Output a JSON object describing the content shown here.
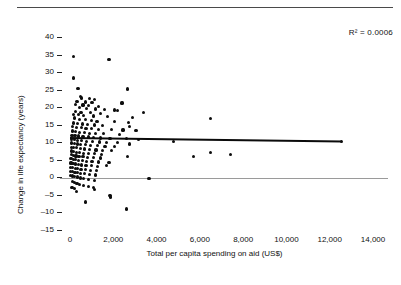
{
  "figure": {
    "has_top_rule": true,
    "background_color": "#ffffff",
    "point_color": "#0d0d0d",
    "trendline_color": "#0b0b0b",
    "zeroline_color": "#9a9a9a"
  },
  "annotations": {
    "r_squared": "R² = 0.0006"
  },
  "chart_data": {
    "type": "scatter",
    "title": "",
    "xlabel": "Total per capita spending on aid (US$)",
    "ylabel": "Change in life expectancy (years)",
    "xlim": [
      0,
      14000
    ],
    "ylim": [
      -15,
      40
    ],
    "xticks": [
      0,
      2000,
      4000,
      6000,
      8000,
      10000,
      12000,
      14000
    ],
    "xtick_labels": [
      "0",
      "2,000",
      "4,000",
      "6,000",
      "8,000",
      "10,000",
      "12,000",
      "14,000"
    ],
    "yticks": [
      -15,
      -10,
      -5,
      0,
      5,
      10,
      15,
      20,
      25,
      30,
      35,
      40
    ],
    "ytick_labels": [
      "–15",
      "–10",
      "–5",
      "0",
      "5",
      "10",
      "15",
      "20",
      "25",
      "30",
      "35",
      "40"
    ],
    "grid": false,
    "legend": null,
    "reference_lines": [
      {
        "name": "zero-line",
        "orientation": "horizontal",
        "y": 0
      }
    ],
    "trendline": {
      "name": "linear-fit",
      "x_start": 0,
      "y_start": 11.2,
      "x_end": 12550,
      "y_end": 10.2,
      "r_squared": 0.0006
    },
    "annotations": [
      {
        "text": "R² = 0.0006",
        "x": 12600,
        "y": 39
      }
    ],
    "points": [
      [
        150,
        34.5
      ],
      [
        1800,
        33.6
      ],
      [
        160,
        28.3
      ],
      [
        330,
        25.4
      ],
      [
        380,
        25.3
      ],
      [
        2650,
        25.2
      ],
      [
        480,
        23.0
      ],
      [
        540,
        22.6
      ],
      [
        900,
        22.4
      ],
      [
        1150,
        22.2
      ],
      [
        320,
        21.7
      ],
      [
        700,
        21.5
      ],
      [
        1020,
        21.3
      ],
      [
        2400,
        21.2
      ],
      [
        250,
        20.8
      ],
      [
        600,
        20.6
      ],
      [
        860,
        20.5
      ],
      [
        1300,
        20.1
      ],
      [
        430,
        19.9
      ],
      [
        760,
        19.7
      ],
      [
        1180,
        19.5
      ],
      [
        1600,
        19.4
      ],
      [
        2050,
        19.2
      ],
      [
        2200,
        19.0
      ],
      [
        240,
        18.8
      ],
      [
        510,
        18.6
      ],
      [
        940,
        18.4
      ],
      [
        1400,
        18.3
      ],
      [
        3400,
        18.5
      ],
      [
        180,
        18.0
      ],
      [
        390,
        17.8
      ],
      [
        640,
        17.7
      ],
      [
        1100,
        17.5
      ],
      [
        1750,
        17.4
      ],
      [
        2900,
        17.1
      ],
      [
        6500,
        16.7
      ],
      [
        210,
        16.9
      ],
      [
        450,
        16.6
      ],
      [
        700,
        16.4
      ],
      [
        980,
        16.2
      ],
      [
        1250,
        16.0
      ],
      [
        2050,
        15.9
      ],
      [
        2700,
        15.6
      ],
      [
        170,
        15.5
      ],
      [
        360,
        15.3
      ],
      [
        560,
        15.2
      ],
      [
        820,
        15.0
      ],
      [
        1150,
        14.9
      ],
      [
        1500,
        14.7
      ],
      [
        2750,
        14.6
      ],
      [
        130,
        14.5
      ],
      [
        300,
        14.3
      ],
      [
        520,
        14.2
      ],
      [
        740,
        14.0
      ],
      [
        1000,
        13.9
      ],
      [
        1320,
        13.7
      ],
      [
        1900,
        13.6
      ],
      [
        2450,
        13.5
      ],
      [
        3050,
        13.4
      ],
      [
        110,
        13.2
      ],
      [
        270,
        13.1
      ],
      [
        440,
        12.9
      ],
      [
        660,
        12.8
      ],
      [
        900,
        12.6
      ],
      [
        1180,
        12.5
      ],
      [
        1550,
        12.4
      ],
      [
        2300,
        12.2
      ],
      [
        90,
        12.0
      ],
      [
        230,
        11.9
      ],
      [
        410,
        11.8
      ],
      [
        600,
        11.6
      ],
      [
        850,
        11.5
      ],
      [
        1100,
        11.3
      ],
      [
        1420,
        11.2
      ],
      [
        1850,
        11.1
      ],
      [
        2600,
        11.0
      ],
      [
        3150,
        10.9
      ],
      [
        80,
        10.8
      ],
      [
        200,
        10.7
      ],
      [
        350,
        10.5
      ],
      [
        530,
        10.4
      ],
      [
        780,
        10.3
      ],
      [
        1050,
        10.2
      ],
      [
        1350,
        10.1
      ],
      [
        1700,
        10.0
      ],
      [
        2200,
        9.9
      ],
      [
        4800,
        10.3
      ],
      [
        70,
        9.8
      ],
      [
        190,
        9.7
      ],
      [
        330,
        9.5
      ],
      [
        500,
        9.4
      ],
      [
        720,
        9.3
      ],
      [
        960,
        9.1
      ],
      [
        1260,
        9.0
      ],
      [
        1620,
        8.9
      ],
      [
        2050,
        8.8
      ],
      [
        2750,
        9.5
      ],
      [
        65,
        8.6
      ],
      [
        180,
        8.5
      ],
      [
        310,
        8.4
      ],
      [
        470,
        8.2
      ],
      [
        680,
        8.1
      ],
      [
        900,
        8.0
      ],
      [
        1200,
        7.8
      ],
      [
        1500,
        7.7
      ],
      [
        1900,
        7.6
      ],
      [
        60,
        7.5
      ],
      [
        170,
        7.3
      ],
      [
        290,
        7.2
      ],
      [
        440,
        7.1
      ],
      [
        640,
        6.9
      ],
      [
        860,
        6.8
      ],
      [
        1120,
        6.7
      ],
      [
        1450,
        6.5
      ],
      [
        6500,
        7.0
      ],
      [
        55,
        6.4
      ],
      [
        160,
        6.3
      ],
      [
        280,
        6.1
      ],
      [
        420,
        6.0
      ],
      [
        600,
        5.9
      ],
      [
        820,
        5.7
      ],
      [
        1080,
        5.6
      ],
      [
        1400,
        5.5
      ],
      [
        2650,
        5.9
      ],
      [
        5700,
        6.0
      ],
      [
        7400,
        6.5
      ],
      [
        50,
        5.3
      ],
      [
        150,
        5.2
      ],
      [
        260,
        5.0
      ],
      [
        400,
        4.9
      ],
      [
        570,
        4.8
      ],
      [
        780,
        4.6
      ],
      [
        1020,
        4.5
      ],
      [
        1330,
        4.4
      ],
      [
        1800,
        4.2
      ],
      [
        45,
        4.1
      ],
      [
        140,
        4.0
      ],
      [
        250,
        3.8
      ],
      [
        380,
        3.7
      ],
      [
        540,
        3.5
      ],
      [
        740,
        3.4
      ],
      [
        980,
        3.3
      ],
      [
        1280,
        3.1
      ],
      [
        1700,
        3.3
      ],
      [
        40,
        2.9
      ],
      [
        130,
        2.8
      ],
      [
        240,
        2.6
      ],
      [
        360,
        2.5
      ],
      [
        510,
        2.3
      ],
      [
        700,
        2.2
      ],
      [
        930,
        2.0
      ],
      [
        1220,
        1.9
      ],
      [
        35,
        1.7
      ],
      [
        120,
        1.6
      ],
      [
        230,
        1.4
      ],
      [
        340,
        1.3
      ],
      [
        490,
        1.1
      ],
      [
        670,
        1.0
      ],
      [
        890,
        0.8
      ],
      [
        1170,
        0.7
      ],
      [
        30,
        0.5
      ],
      [
        110,
        0.4
      ],
      [
        220,
        0.2
      ],
      [
        330,
        0.1
      ],
      [
        470,
        -0.2
      ],
      [
        640,
        -0.4
      ],
      [
        860,
        -0.6
      ],
      [
        1130,
        -0.8
      ],
      [
        3650,
        -0.4
      ],
      [
        100,
        -1.2
      ],
      [
        210,
        -1.5
      ],
      [
        320,
        -1.8
      ],
      [
        450,
        -2.1
      ],
      [
        620,
        -2.4
      ],
      [
        840,
        -2.7
      ],
      [
        1100,
        -3.0
      ],
      [
        90,
        -2.9
      ],
      [
        200,
        -3.2
      ],
      [
        1150,
        -3.4
      ],
      [
        310,
        -4.0
      ],
      [
        1850,
        -5.2
      ],
      [
        1870,
        -5.6
      ],
      [
        700,
        -7.0
      ],
      [
        2600,
        -9.0
      ]
    ]
  }
}
